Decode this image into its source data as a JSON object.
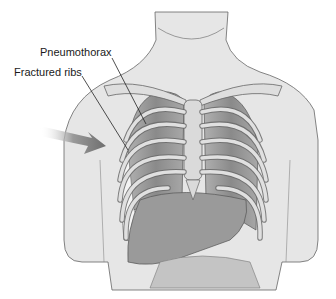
{
  "figure": {
    "labels": [
      {
        "id": "pneumothorax",
        "text": "Pneumothorax"
      },
      {
        "id": "fractured-ribs",
        "text": "Fractured ribs"
      }
    ],
    "caption": "",
    "colors": {
      "skin": "#e4e4e4",
      "bone": "#dcdcdc",
      "lung": "#8e8e8e",
      "organ": "#9a9a9a",
      "outline": "#555555",
      "arrow": "#7a7a7a"
    }
  }
}
